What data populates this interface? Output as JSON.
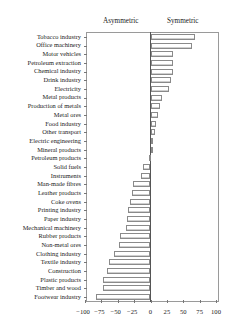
{
  "chart_data": {
    "type": "bar",
    "orientation": "horizontal",
    "title": "",
    "column_headers": [
      "Asymmetric",
      "Symmetric"
    ],
    "xlabel": "",
    "ylabel": "",
    "xlim": [
      -100,
      100
    ],
    "x_ticks": [
      "−100",
      "−75",
      "−50",
      "−25",
      "0",
      "25",
      "50",
      "75",
      "100"
    ],
    "x_tick_values": [
      -100,
      -75,
      -50,
      -25,
      0,
      25,
      50,
      75,
      100
    ],
    "grid": false,
    "legend": null,
    "categories": [
      "Tobacco industry",
      "Office machinery",
      "Motor vehicles",
      "Petroleum extraction",
      "Chemical industry",
      "Drink industry",
      "Electricity",
      "Metal products",
      "Production of metals",
      "Metal ores",
      "Food industry",
      "Other transport",
      "Electric engineering",
      "Mineral products",
      "Petroleum products",
      "Solid fuels",
      "Instruments",
      "Man-made fibres",
      "Leather products",
      "Coke ovens",
      "Printing industry",
      "Paper industry",
      "Mechanical machinery",
      "Rubber products",
      "Non-metal ores",
      "Clothing industry",
      "Textile industry",
      "Construction",
      "Plastic products",
      "Timber and wood",
      "Footwear industry"
    ],
    "values": [
      68,
      63,
      35,
      35,
      34,
      31,
      28,
      18,
      14,
      11,
      9,
      7,
      3,
      1,
      -1,
      -11,
      -15,
      -26,
      -28,
      -31,
      -35,
      -36,
      -38,
      -46,
      -48,
      -55,
      -63,
      -66,
      -72,
      -72,
      -83
    ]
  }
}
